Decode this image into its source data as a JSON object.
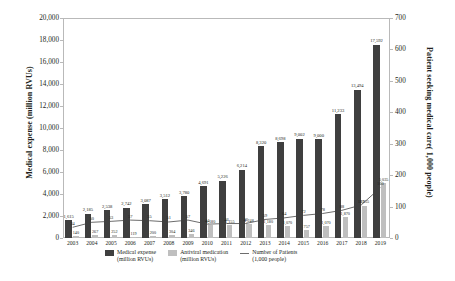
{
  "chart_data": {
    "type": "bar",
    "title": "",
    "subtitle": "",
    "xlabel": "",
    "ylabel": "Medical expense (million RVUs)",
    "y2label": "Patient seeking medical care( 1,000 people)",
    "categories": [
      "2003",
      "2004",
      "2005",
      "2006",
      "2007",
      "2008",
      "2009",
      "2010",
      "2011",
      "2012",
      "2013",
      "2014",
      "2015",
      "2016",
      "2017",
      "2018",
      "2019"
    ],
    "ylim": [
      0,
      20000
    ],
    "y2lim": [
      0,
      700
    ],
    "yticks": [
      "0",
      "2,000",
      "4,000",
      "6,000",
      "8,000",
      "10,000",
      "12,000",
      "14,000",
      "16,000",
      "18,000",
      "20,000"
    ],
    "y2ticks": [
      "0",
      "100",
      "200",
      "300",
      "400",
      "500",
      "600",
      "700"
    ],
    "grid": false,
    "legend_position": "bottom",
    "series": [
      {
        "name": "Medical expense (million RVUs)",
        "type": "bar",
        "axis": "left",
        "color": "#3f3f3f",
        "values": [
          1615,
          2185,
          2538,
          2742,
          3087,
          3512,
          3780,
          4691,
          5226,
          6214,
          8320,
          8698,
          9002,
          9000,
          11233,
          13494,
          17592
        ],
        "labels": [
          "1,615",
          "2,185",
          "2,538",
          "2,742",
          "3,087",
          "3,512",
          "3,780",
          "4,691",
          "5,226",
          "6,214",
          "8,320",
          "8,698",
          "9,002",
          "9,000",
          "11,233",
          "13,494",
          "17,592"
        ]
      },
      {
        "name": "Antiviral medication (million RVUs)",
        "type": "bar",
        "axis": "left",
        "color": "#bfbfbf",
        "values": [
          140,
          267,
          252,
          119,
          200,
          304,
          346,
          1180,
          1155,
          1248,
          1180,
          1070,
          757,
          1070,
          1870,
          2955,
          5035
        ],
        "labels": [
          "140",
          "267",
          "252",
          "119",
          "200",
          "304",
          "346",
          "1,180",
          "1,155",
          "1,248",
          "1,180",
          "1,070",
          "757",
          "1,070",
          "1,870",
          "2,955",
          "5,035"
        ]
      },
      {
        "name": "Number of Patients (1,000 people)",
        "type": "line",
        "axis": "right",
        "color": "#6d6d6d",
        "values": [
          34,
          50,
          53,
          57,
          55,
          51,
          57,
          44,
          46,
          46,
          59,
          64,
          72,
          78,
          88,
          105,
          160
        ],
        "labels": [
          "34",
          "50",
          "53",
          "57",
          "55",
          "51",
          "57",
          "44",
          "46",
          "46",
          "59",
          "64",
          "72",
          "78",
          "88",
          "105",
          "160"
        ]
      }
    ]
  },
  "legend": {
    "items": [
      {
        "label_line1": "Medical expense",
        "label_line2": "(million RVUs)",
        "swatch": "expense"
      },
      {
        "label_line1": "Antiviral medication",
        "label_line2": "(million RVUs)",
        "swatch": "antiviral"
      },
      {
        "label_line1": "Number of Patients",
        "label_line2": "(1,000 people)",
        "swatch": "line"
      }
    ]
  }
}
